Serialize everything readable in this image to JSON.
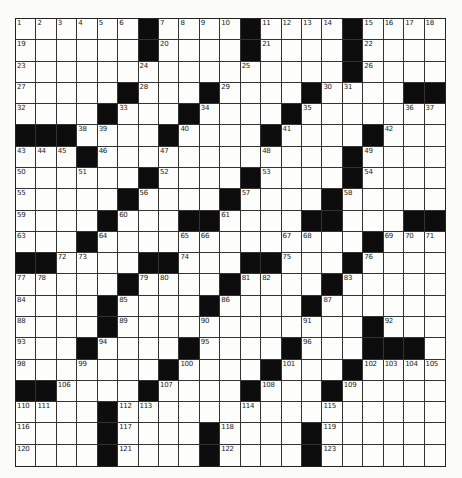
{
  "puzzle": {
    "rows": 21,
    "cols": 21,
    "colors": {
      "black_square": "#0d0d0d",
      "white_square": "#fdfdfb",
      "grid_line": "#333333",
      "background": "#fbfbf9"
    },
    "grid": [
      "......#....#....#....",
      "......#....#....#....",
      "................#....",
      ".....#...#....#....##",
      "....#...#....#.......",
      "###....#....#....#...",
      "...#............#....",
      "......#....#....#....",
      ".....#....#....#.....",
      "....#...##....##...##",
      "...#.............#...",
      "##....##...##...#....",
      ".....#....#....#.....",
      "....#....#....#......",
      "....#............#...",
      "...#....#....#...###.",
      ".......#....#...#....",
      "##....#....#...#.....",
      "....#................",
      "....#....#....#......",
      "....#....#....#......"
    ],
    "numbers": [
      [
        [
          0,
          1
        ],
        [
          1,
          2
        ],
        [
          2,
          3
        ],
        [
          3,
          4
        ],
        [
          4,
          5
        ],
        [
          5,
          6
        ],
        [
          7,
          7
        ],
        [
          8,
          8
        ],
        [
          9,
          9
        ],
        [
          10,
          10
        ],
        [
          12,
          11
        ],
        [
          13,
          12
        ],
        [
          14,
          13
        ],
        [
          15,
          14
        ],
        [
          17,
          15
        ],
        [
          18,
          16
        ],
        [
          19,
          17
        ],
        [
          20,
          18
        ]
      ],
      [
        [
          0,
          19
        ],
        [
          7,
          20
        ],
        [
          12,
          21
        ],
        [
          17,
          22
        ]
      ],
      [
        [
          0,
          23
        ],
        [
          6,
          24
        ],
        [
          11,
          25
        ],
        [
          17,
          26
        ]
      ],
      [
        [
          0,
          27
        ],
        [
          6,
          28
        ],
        [
          10,
          29
        ],
        [
          15,
          30
        ],
        [
          16,
          31
        ]
      ],
      [
        [
          0,
          32
        ],
        [
          5,
          33
        ],
        [
          9,
          34
        ],
        [
          14,
          35
        ],
        [
          19,
          36
        ],
        [
          20,
          37
        ]
      ],
      [
        [
          3,
          38
        ],
        [
          4,
          39
        ],
        [
          8,
          40
        ],
        [
          13,
          41
        ],
        [
          18,
          42
        ]
      ],
      [
        [
          0,
          43
        ],
        [
          1,
          44
        ],
        [
          2,
          45
        ],
        [
          4,
          46
        ],
        [
          7,
          47
        ],
        [
          12,
          48
        ],
        [
          17,
          49
        ]
      ],
      [
        [
          0,
          50
        ],
        [
          3,
          51
        ],
        [
          7,
          52
        ],
        [
          12,
          53
        ],
        [
          17,
          54
        ]
      ],
      [
        [
          0,
          55
        ],
        [
          6,
          56
        ],
        [
          11,
          57
        ],
        [
          16,
          58
        ]
      ],
      [
        [
          0,
          59
        ],
        [
          5,
          60
        ],
        [
          10,
          61
        ],
        [
          15,
          62
        ]
      ],
      [
        [
          0,
          63
        ],
        [
          4,
          64
        ],
        [
          8,
          65
        ],
        [
          9,
          66
        ],
        [
          13,
          67
        ],
        [
          14,
          68
        ],
        [
          18,
          69
        ],
        [
          19,
          70
        ],
        [
          20,
          71
        ]
      ],
      [
        [
          2,
          72
        ],
        [
          3,
          73
        ],
        [
          8,
          74
        ],
        [
          13,
          75
        ],
        [
          17,
          76
        ]
      ],
      [
        [
          0,
          77
        ],
        [
          1,
          78
        ],
        [
          6,
          79
        ],
        [
          7,
          80
        ],
        [
          11,
          81
        ],
        [
          12,
          82
        ],
        [
          16,
          83
        ]
      ],
      [
        [
          0,
          84
        ],
        [
          5,
          85
        ],
        [
          10,
          86
        ],
        [
          15,
          87
        ]
      ],
      [
        [
          0,
          88
        ],
        [
          5,
          89
        ],
        [
          9,
          90
        ],
        [
          14,
          91
        ],
        [
          18,
          92
        ]
      ],
      [
        [
          0,
          93
        ],
        [
          4,
          94
        ],
        [
          9,
          95
        ],
        [
          14,
          96
        ],
        [
          17,
          97
        ]
      ],
      [
        [
          0,
          98
        ],
        [
          3,
          99
        ],
        [
          8,
          100
        ],
        [
          13,
          101
        ],
        [
          17,
          102
        ],
        [
          18,
          103
        ],
        [
          19,
          104
        ],
        [
          20,
          105
        ]
      ],
      [
        [
          2,
          106
        ],
        [
          7,
          107
        ],
        [
          12,
          108
        ],
        [
          16,
          109
        ]
      ],
      [
        [
          0,
          110
        ],
        [
          1,
          111
        ],
        [
          5,
          112
        ],
        [
          6,
          113
        ],
        [
          11,
          114
        ],
        [
          15,
          115
        ]
      ],
      [
        [
          0,
          116
        ],
        [
          5,
          117
        ],
        [
          10,
          118
        ],
        [
          15,
          119
        ]
      ],
      [
        [
          0,
          120
        ],
        [
          5,
          121
        ],
        [
          10,
          122
        ],
        [
          15,
          123
        ]
      ]
    ]
  }
}
